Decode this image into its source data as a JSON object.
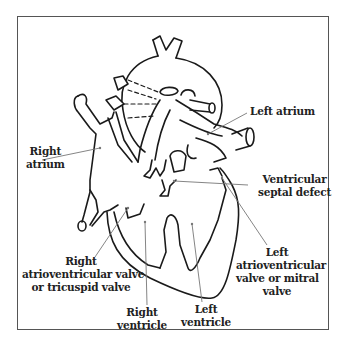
{
  "diagram": {
    "labels": {
      "left_atrium": "Left atrium",
      "right_atrium_l1": "Right",
      "right_atrium_l2": "atrium",
      "vsd_l1": "Ventricular",
      "vsd_l2": "septal defect",
      "tricuspid_l1": "Right",
      "tricuspid_l2": "atrioventricular valve",
      "tricuspid_l3": "or tricuspid valve",
      "mitral_l1": "Left",
      "mitral_l2": "atrioventricular",
      "mitral_l3": "valve or mitral",
      "mitral_l4": "valve",
      "rv_l1": "Right",
      "rv_l2": "ventricle",
      "lv_l1": "Left",
      "lv_l2": "ventricle"
    },
    "colors": {
      "line": "#1a1a1a",
      "pointer": "#777777",
      "frame": "#555555",
      "background": "#ffffff"
    }
  }
}
